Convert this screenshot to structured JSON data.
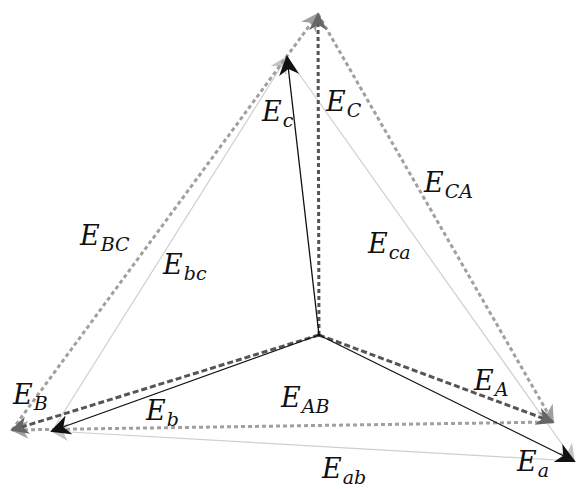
{
  "diagram": {
    "colors": {
      "phase_solid": "#111111",
      "phase_dashed": "#555555",
      "line_dashed": "#9a9a9a",
      "line_thin": "#cfcfcf",
      "text": "#111111"
    },
    "points": {
      "O": [
        319,
        335
      ],
      "A": [
        553,
        422
      ],
      "B": [
        12,
        430
      ],
      "C": [
        318,
        14
      ],
      "a": [
        574,
        461
      ],
      "b": [
        52,
        431
      ],
      "c": [
        287,
        57
      ]
    },
    "vectors": [
      {
        "id": "E_A",
        "from": "O",
        "to": "A",
        "style": "dashed-dark"
      },
      {
        "id": "E_B",
        "from": "O",
        "to": "B",
        "style": "dashed-dark"
      },
      {
        "id": "E_C",
        "from": "O",
        "to": "C",
        "style": "dashed-dark"
      },
      {
        "id": "E_a",
        "from": "O",
        "to": "a",
        "style": "solid"
      },
      {
        "id": "E_b",
        "from": "O",
        "to": "b",
        "style": "solid"
      },
      {
        "id": "E_c",
        "from": "O",
        "to": "c",
        "style": "solid"
      },
      {
        "id": "E_AB",
        "from": "A",
        "to": "B",
        "style": "dashed-light"
      },
      {
        "id": "E_BC",
        "from": "B",
        "to": "C",
        "style": "dashed-light"
      },
      {
        "id": "E_CA",
        "from": "C",
        "to": "A",
        "style": "dashed-light"
      },
      {
        "id": "E_ab",
        "from": "a",
        "to": "b",
        "style": "thin"
      },
      {
        "id": "E_bc",
        "from": "b",
        "to": "c",
        "style": "thin"
      },
      {
        "id": "E_ca",
        "from": "c",
        "to": "a",
        "style": "thin"
      }
    ]
  },
  "labels": {
    "E_C": {
      "base": "E",
      "sub": "C"
    },
    "E_c": {
      "base": "E",
      "sub": "c"
    },
    "E_CA": {
      "base": "E",
      "sub": "CA"
    },
    "E_ca": {
      "base": "E",
      "sub": "ca"
    },
    "E_BC": {
      "base": "E",
      "sub": "BC"
    },
    "E_bc": {
      "base": "E",
      "sub": "bc"
    },
    "E_B": {
      "base": "E",
      "sub": "B"
    },
    "E_b": {
      "base": "E",
      "sub": "b"
    },
    "E_AB": {
      "base": "E",
      "sub": "AB"
    },
    "E_A": {
      "base": "E",
      "sub": "A"
    },
    "E_a": {
      "base": "E",
      "sub": "a"
    },
    "E_ab": {
      "base": "E",
      "sub": "ab"
    }
  }
}
